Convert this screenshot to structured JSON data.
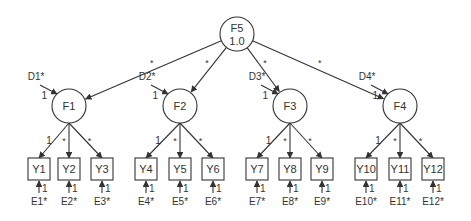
{
  "diagram": {
    "type": "higher-order confirmatory factor analysis path diagram",
    "colors": {
      "stroke": "#333333",
      "text": "#333333",
      "background": "#ffffff"
    },
    "second_order_factor": {
      "id": "F5",
      "label": "F5",
      "variance": "1.0",
      "cx": 237,
      "cy": 34
    },
    "first_order_factors": [
      {
        "id": "F1",
        "label": "F1",
        "cx": 69,
        "cy": 106,
        "path_from_F5": "*",
        "disturbance": {
          "label": "D1*",
          "loading": "1"
        }
      },
      {
        "id": "F2",
        "label": "F2",
        "cx": 180,
        "cy": 106,
        "path_from_F5": "*",
        "disturbance": {
          "label": "D2*",
          "loading": "1"
        }
      },
      {
        "id": "F3",
        "label": "F3",
        "cx": 290,
        "cy": 106,
        "path_from_F5": "*",
        "disturbance": {
          "label": "D3*",
          "loading": "1"
        }
      },
      {
        "id": "F4",
        "label": "F4",
        "cx": 400,
        "cy": 106,
        "path_from_F5": "*",
        "disturbance": {
          "label": "D4*",
          "loading": "1"
        }
      }
    ],
    "indicators": [
      {
        "label": "Y1",
        "factor": "F1",
        "loading": "1",
        "error": "E1*",
        "error_loading": "1",
        "cx": 39
      },
      {
        "label": "Y2",
        "factor": "F1",
        "loading": "*",
        "error": "E2*",
        "error_loading": "1",
        "cx": 69
      },
      {
        "label": "Y3",
        "factor": "F1",
        "loading": "*",
        "error": "E3*",
        "error_loading": "1",
        "cx": 102
      },
      {
        "label": "Y4",
        "factor": "F2",
        "loading": "1",
        "error": "E4*",
        "error_loading": "1",
        "cx": 146
      },
      {
        "label": "Y5",
        "factor": "F2",
        "loading": "*",
        "error": "E5*",
        "error_loading": "1",
        "cx": 180
      },
      {
        "label": "Y6",
        "factor": "F2",
        "loading": "*",
        "error": "E6*",
        "error_loading": "1",
        "cx": 213
      },
      {
        "label": "Y7",
        "factor": "F3",
        "loading": "1",
        "error": "E7*",
        "error_loading": "1",
        "cx": 257
      },
      {
        "label": "Y8",
        "factor": "F3",
        "loading": "*",
        "error": "E8*",
        "error_loading": "1",
        "cx": 290
      },
      {
        "label": "Y9",
        "factor": "F3",
        "loading": "*",
        "error": "E9*",
        "error_loading": "1",
        "cx": 322
      },
      {
        "label": "Y10",
        "factor": "F4",
        "loading": "1",
        "error": "E10*",
        "error_loading": "1",
        "cx": 366
      },
      {
        "label": "Y11",
        "factor": "F4",
        "loading": "*",
        "error": "E11*",
        "error_loading": "1",
        "cx": 400
      },
      {
        "label": "Y12",
        "factor": "F4",
        "loading": "*",
        "error": "E12*",
        "error_loading": "1",
        "cx": 433
      }
    ]
  }
}
